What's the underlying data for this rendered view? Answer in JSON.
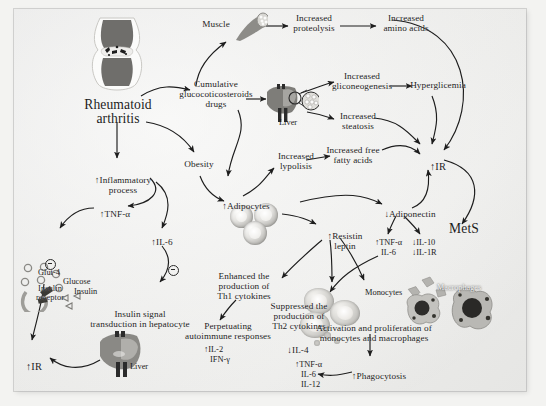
{
  "figure": {
    "domain": "biomedical-pathway-diagram",
    "title_node": "Rheumatoid arthritis",
    "background_hex": "#f2f2f0",
    "ink_hex": "#1c1c1c"
  },
  "nodes": {
    "rheumatoid_arthritis": "Rheumatoid\narthritis",
    "muscle": "Muscle",
    "increased_proteolysis": "Increased\nproteolysis",
    "increased_amino_acids": "Increased\namino acids",
    "cumulative_drugs": "Cumulative\nglucocoticosteroids\ndrugs",
    "liver_top": "Liver",
    "increased_gliconeogenesis": "Increased\ngliconeogenesis",
    "hyperglicemia": "Hyperglicemia",
    "increased_steatosis": "Increased\nsteatosis",
    "increased_free_fatty_acids": "Increased free\nfatty acids",
    "ir_right": "IR",
    "mets": "MetS",
    "inflammatory_process": "Inflammatory\nprocess",
    "obesity": "Obesity",
    "increased_lypolisis": "Increased\nlypolisis",
    "adipocytes": "Adipocytes",
    "adiponectin": "Adiponectin",
    "resistin_leptin": "Resistin\nleptin",
    "tnf_alpha_left": "TNF-α",
    "il6_left": "IL-6",
    "glut4": "Glut-4",
    "glucose": "Glucose",
    "insulin_receptor": "Insulin\nreceptor",
    "insulin": "Insulin",
    "insulin_signal": "Insulin signal\ntransduction in hepatocyte",
    "liver_bottom": "Liver",
    "ir_left": "IR",
    "enhanced_th1": "Enhanced the\nproduction of\nTh1 cytokines",
    "perpetuating": "Perpetuating\nautoimmune responses",
    "suppressed_th2": "Suppressed the\nproduction of\nTh2 cytokines",
    "il4": "IL-4",
    "monocytes": "Monocytes",
    "macrophages": "Macrophages",
    "activation_proliferation": "Activation and proliferation of\nmonocytes and macrophages",
    "phagocytosis": "Phagocytosis"
  },
  "cytokine_groups": {
    "adiponectin_up": {
      "arrow": "↑",
      "items": [
        "TNF-α",
        "IL-6"
      ]
    },
    "adiponectin_down": {
      "arrow": "↓",
      "items": [
        "IL-10",
        "IL-1R"
      ]
    },
    "th1_products": {
      "arrow": "↑",
      "items": [
        "IL-2",
        "IFN-γ"
      ]
    },
    "macrophage_products": {
      "arrow": "↑",
      "items": [
        "TNF-α",
        "IL-6",
        "IL-12"
      ]
    }
  },
  "arrows": {
    "up": "↑",
    "down": "↓"
  },
  "inhibition_symbol": "−"
}
